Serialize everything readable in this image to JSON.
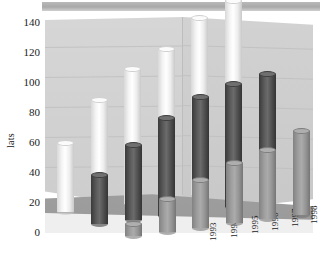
{
  "chart_data": {
    "type": "bar",
    "title": "",
    "subtitle": "",
    "xlabel": "",
    "ylabel": "lats",
    "ylim": [
      0,
      140
    ],
    "yticks": [
      0,
      20,
      40,
      60,
      80,
      100,
      120,
      140
    ],
    "grid": true,
    "legend": "none",
    "projection": "3d-cylinder",
    "categories": [
      "1993",
      "1994",
      "1995",
      "1996",
      "1997",
      "1998"
    ],
    "series": [
      {
        "name": "back-row",
        "color": "#f4f4f4",
        "values": [
          46,
          72,
          90,
          100,
          118,
          127
        ]
      },
      {
        "name": "mid-row",
        "color": "#4e4e4e",
        "values": [
          33,
          50,
          65,
          76,
          82,
          86
        ]
      },
      {
        "name": "front-row",
        "color": "#9a9a9a",
        "values": [
          8,
          22,
          32,
          40,
          46,
          56
        ]
      }
    ],
    "extra_back_values": [
      60,
      74,
      81,
      90,
      96
    ]
  },
  "axis": {
    "y_title": "lats",
    "y_ticks": [
      "140",
      "120",
      "100",
      "80",
      "60",
      "40",
      "20",
      "0"
    ],
    "x_ticks": [
      "1993",
      "1994",
      "1995",
      "1996",
      "1997",
      "1998"
    ]
  },
  "colors": {
    "back_series": "#f4f4f4",
    "mid_series": "#4e4e4e",
    "front_series": "#9a9a9a",
    "wall": "#d2d2d2",
    "floor": "#9c9c9c",
    "banner": "#b0b0b0"
  }
}
